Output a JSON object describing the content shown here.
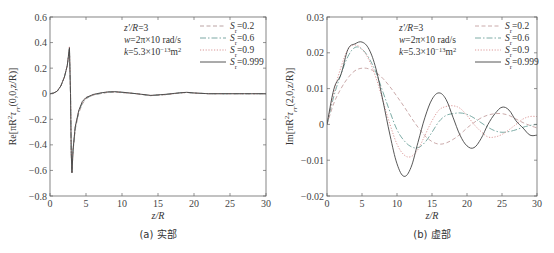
{
  "chart_data": [
    {
      "type": "line",
      "panel": "a",
      "caption": "(a) 实部",
      "xlabel": "z/R",
      "ylabel": "Re[πR²τ_rr(0,0,z/R)]",
      "xlim": [
        0,
        30
      ],
      "ylim": [
        -0.8,
        0.6
      ],
      "xticks": [
        "0",
        "5",
        "10",
        "15",
        "20",
        "25",
        "30"
      ],
      "yticks": [
        "0.6",
        "0.4",
        "0.2",
        "0",
        "−0.2",
        "−0.4",
        "−0.6",
        "−0.8"
      ],
      "grid": false,
      "annotations": [
        "z'/R=3",
        "w=2π×10 rad/s",
        "k=5.3×10⁻¹³m²"
      ],
      "legend_position": "top-right",
      "x": [
        0,
        0.5,
        1,
        1.5,
        2,
        2.4,
        2.7,
        2.85,
        2.95,
        3.05,
        3.2,
        3.5,
        4,
        4.5,
        5,
        6,
        7,
        8,
        9,
        10,
        12,
        14,
        16,
        18,
        19,
        20,
        22,
        25,
        28,
        30
      ],
      "series": [
        {
          "name": "S_r=0.2",
          "style": "dashed",
          "color": "#b39a9a",
          "values": [
            0,
            0.005,
            0.02,
            0.06,
            0.13,
            0.22,
            0.35,
            0.0,
            -0.45,
            -0.6,
            -0.45,
            -0.28,
            -0.15,
            -0.08,
            -0.04,
            -0.01,
            0.0,
            0.01,
            0.012,
            0.008,
            0.0,
            -0.015,
            -0.008,
            0.005,
            0.01,
            0.005,
            0.0,
            0.0,
            0.0,
            0.0
          ]
        },
        {
          "name": "S_r=0.6",
          "style": "dashdot",
          "color": "#6e9e9a",
          "values": [
            0,
            0.005,
            0.02,
            0.06,
            0.13,
            0.22,
            0.36,
            0.0,
            -0.46,
            -0.61,
            -0.45,
            -0.27,
            -0.14,
            -0.07,
            -0.035,
            -0.01,
            0.003,
            0.012,
            0.014,
            0.01,
            0.0,
            -0.015,
            -0.007,
            0.006,
            0.01,
            0.005,
            0.0,
            0.0,
            0.0,
            0.0
          ]
        },
        {
          "name": "S_r=0.9",
          "style": "dotted",
          "color": "#d48a8a",
          "values": [
            0,
            0.005,
            0.02,
            0.06,
            0.13,
            0.22,
            0.37,
            0.0,
            -0.47,
            -0.62,
            -0.44,
            -0.26,
            -0.13,
            -0.065,
            -0.03,
            -0.008,
            0.005,
            0.013,
            0.015,
            0.011,
            0.0,
            -0.014,
            -0.006,
            0.006,
            0.01,
            0.005,
            0.0,
            0.0,
            0.0,
            0.0
          ]
        },
        {
          "name": "S_r=0.999",
          "style": "solid",
          "color": "#444444",
          "values": [
            0,
            0.005,
            0.02,
            0.06,
            0.13,
            0.22,
            0.36,
            0.0,
            -0.47,
            -0.62,
            -0.44,
            -0.26,
            -0.13,
            -0.06,
            -0.03,
            -0.006,
            0.006,
            0.014,
            0.016,
            0.012,
            0.0,
            -0.013,
            -0.005,
            0.007,
            0.011,
            0.006,
            0.0,
            0.0,
            0.0,
            0.0
          ]
        }
      ]
    },
    {
      "type": "line",
      "panel": "b",
      "caption": "(b) 虚部",
      "xlabel": "z/R",
      "ylabel": "Im[πR²τ_rr(2,0,z/R)]",
      "xlim": [
        0,
        30
      ],
      "ylim": [
        -0.02,
        0.03
      ],
      "xticks": [
        "0",
        "5",
        "10",
        "15",
        "20",
        "25",
        "30"
      ],
      "yticks": [
        "0.03",
        "0.02",
        "0.01",
        "0",
        "−0.01",
        "−0.02"
      ],
      "grid": false,
      "annotations": [
        "z'/R=3",
        "w=2π×10 rad/s",
        "k=5.3×10⁻¹³m²"
      ],
      "legend_position": "top-right",
      "x": [
        0,
        1,
        2,
        3,
        4,
        5,
        6,
        7,
        8,
        9,
        10,
        11,
        12,
        13,
        14,
        15,
        16,
        17,
        18,
        19,
        20,
        21,
        22,
        23,
        24,
        25,
        26,
        27,
        28,
        29,
        30
      ],
      "series": [
        {
          "name": "S_r=0.2",
          "style": "dashed",
          "color": "#c4a0a0",
          "values": [
            0,
            0.006,
            0.01,
            0.013,
            0.015,
            0.0157,
            0.0155,
            0.0145,
            0.0128,
            0.0105,
            0.0078,
            0.005,
            0.002,
            -0.0008,
            -0.0032,
            -0.0048,
            -0.0055,
            -0.0052,
            -0.0042,
            -0.0028,
            -0.001,
            0.0005,
            0.0018,
            0.0026,
            0.003,
            0.003,
            0.0025,
            0.0015,
            0.0005,
            -0.0003,
            -0.001
          ]
        },
        {
          "name": "S_r=0.6",
          "style": "dashdot",
          "color": "#6fa39c",
          "values": [
            0,
            0.008,
            0.014,
            0.019,
            0.0215,
            0.021,
            0.0185,
            0.0145,
            0.009,
            0.0035,
            -0.0015,
            -0.0045,
            -0.0062,
            -0.0065,
            -0.005,
            -0.0022,
            0.0008,
            0.0025,
            0.003,
            0.0032,
            0.0028,
            0.0018,
            0.0005,
            -0.0008,
            -0.0018,
            -0.0022,
            -0.002,
            -0.0015,
            -0.0008,
            -0.0003,
            0.0
          ]
        },
        {
          "name": "S_r=0.9",
          "style": "dotted",
          "color": "#d99090",
          "values": [
            0,
            0.009,
            0.016,
            0.021,
            0.0222,
            0.021,
            0.018,
            0.013,
            0.0065,
            0.0,
            -0.0055,
            -0.0085,
            -0.009,
            -0.007,
            -0.003,
            0.001,
            0.004,
            0.005,
            0.0052,
            0.0045,
            0.0025,
            0.0,
            -0.002,
            -0.0035,
            -0.0035,
            -0.0028,
            -0.0015,
            0.0,
            0.0015,
            0.0022,
            0.0022
          ]
        },
        {
          "name": "S_r=0.999",
          "style": "solid",
          "color": "#444444",
          "values": [
            0,
            0.01,
            0.014,
            0.021,
            0.0225,
            0.023,
            0.021,
            0.0155,
            0.0065,
            -0.003,
            -0.011,
            -0.0145,
            -0.012,
            -0.005,
            0.002,
            0.007,
            0.0088,
            0.007,
            0.002,
            -0.003,
            -0.006,
            -0.0065,
            -0.004,
            0.0,
            0.003,
            0.0048,
            0.004,
            0.001,
            -0.001,
            -0.003,
            -0.003
          ]
        }
      ]
    }
  ],
  "panels": {
    "a": {
      "caption": "(a) 实部",
      "xlabel": "z/R",
      "ylabel_prefix": "Re[πR",
      "ylabel_sup": "2",
      "ylabel_mid": "τ",
      "ylabel_sub": "rr",
      "ylabel_suffix": "(0,0,z/R)]",
      "annotations": [
        "z'/R=3",
        "w=2π×10 rad/s",
        "k=5.3×10",
        "−13",
        "m",
        "2"
      ],
      "legend": [
        "S",
        "r",
        "=0.2",
        "=0.6",
        "=0.9",
        "=0.999"
      ]
    },
    "b": {
      "caption": "(b) 虚部",
      "xlabel": "z/R",
      "ylabel_prefix": "Im[πR",
      "ylabel_sup": "2",
      "ylabel_mid": "τ",
      "ylabel_sub": "rr",
      "ylabel_suffix": "(2,0,z/R)]"
    }
  }
}
